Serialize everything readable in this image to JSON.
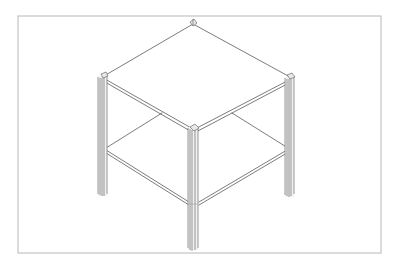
{
  "figure": {
    "colors": {
      "background": "#ffffff",
      "frame": "#b8b8b8",
      "line": "#5a5a5a"
    },
    "frame_rect": {
      "x": 18,
      "y": 16,
      "w": 363,
      "h": 237
    },
    "top_shelf": {
      "back": [
        193,
        23
      ],
      "left": [
        103,
        77
      ],
      "right": [
        290,
        78
      ],
      "front": [
        193,
        128
      ]
    },
    "lower_shelf": {
      "left": [
        103,
        150
      ],
      "right": [
        290,
        150
      ],
      "front": [
        193,
        203
      ],
      "back_left_end": [
        162,
        113
      ],
      "back_right_end": [
        232,
        113
      ]
    },
    "legs": [
      {
        "name": "left",
        "x": 98,
        "y_top": 75,
        "y_bottom": 197
      },
      {
        "name": "right",
        "x": 285,
        "y_top": 76,
        "y_bottom": 197
      },
      {
        "name": "front",
        "x": 188,
        "y_top": 126,
        "y_bottom": 251
      }
    ]
  }
}
